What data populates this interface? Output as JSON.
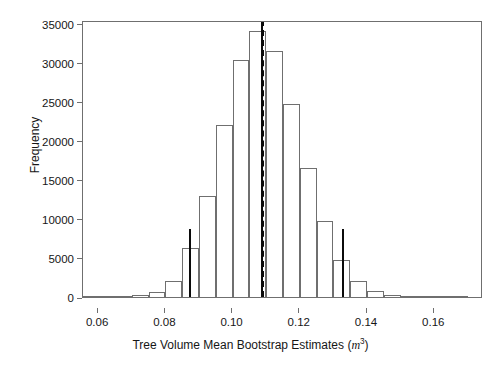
{
  "chart_data": {
    "type": "bar",
    "title": "",
    "subtitle": "",
    "xlabel_text": "Tree Volume Mean Bootstrap Estimates",
    "xlabel_unit_symbol": "m",
    "xlabel_unit_exponent": "3",
    "ylabel": "Frequency",
    "xlim": [
      0.0555,
      0.1745
    ],
    "ylim": [
      0,
      35500
    ],
    "grid": false,
    "legend": null,
    "x_ticks": [
      0.06,
      0.08,
      0.1,
      0.12,
      0.14,
      0.16
    ],
    "x_tick_labels": [
      "0.06",
      "0.08",
      "0.10",
      "0.12",
      "0.14",
      "0.16"
    ],
    "y_ticks": [
      0,
      5000,
      10000,
      15000,
      20000,
      25000,
      30000,
      35000
    ],
    "y_tick_labels": [
      "0",
      "5000",
      "10000",
      "15000",
      "20000",
      "25000",
      "30000",
      "35000"
    ],
    "bin_width": 0.005,
    "bin_edges": [
      0.055,
      0.06,
      0.065,
      0.07,
      0.075,
      0.08,
      0.085,
      0.09,
      0.095,
      0.1,
      0.105,
      0.11,
      0.115,
      0.12,
      0.125,
      0.13,
      0.135,
      0.14,
      0.145,
      0.15,
      0.155,
      0.16,
      0.165,
      0.17
    ],
    "bin_centers": [
      0.0575,
      0.0625,
      0.0675,
      0.0725,
      0.0775,
      0.0825,
      0.0875,
      0.0925,
      0.0975,
      0.1025,
      0.1075,
      0.1125,
      0.1175,
      0.1225,
      0.1275,
      0.1325,
      0.1375,
      0.1425,
      0.1475,
      0.1525,
      0.1575,
      0.1625,
      0.1675
    ],
    "values": [
      0,
      0,
      0,
      200,
      700,
      2000,
      6300,
      12900,
      22100,
      30400,
      34100,
      31500,
      24800,
      16500,
      9700,
      4700,
      2000,
      800,
      250,
      80,
      20,
      0,
      0
    ],
    "annotations": [
      {
        "name": "lower-ci-line",
        "x": 0.0872,
        "y_top": 8700,
        "style": "solid",
        "color": "#0b0b0b"
      },
      {
        "name": "mean-line-solid",
        "x": 0.1088,
        "y_top": 35500,
        "style": "solid",
        "color": "#0b0b0b"
      },
      {
        "name": "mean-line-dashed",
        "x": 0.109,
        "y_top": 35500,
        "style": "dashed",
        "color": "#0b0b0b"
      },
      {
        "name": "upper-ci-line",
        "x": 0.1328,
        "y_top": 8700,
        "style": "solid",
        "color": "#0b0b0b"
      }
    ],
    "colors": {
      "axis": "#6f6f6f",
      "bar_outline": "#6f6f6f",
      "bar_fill": "transparent",
      "annotation": "#0b0b0b",
      "background": "#ffffff",
      "text": "#161616"
    }
  }
}
